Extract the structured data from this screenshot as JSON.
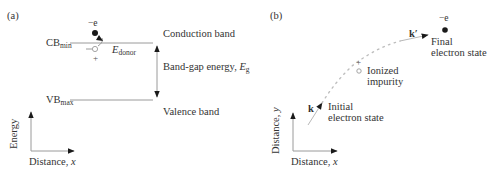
{
  "panel_a": {
    "label": "(a)",
    "electron_charge": "−e",
    "cb_label_main": "CB",
    "cb_label_sub": "min",
    "vb_label_main": "VB",
    "vb_label_sub": "max",
    "donor_minus": "−",
    "donor_plus": "+",
    "e_donor_main": "E",
    "e_donor_sub": "donor",
    "conduction_band": "Conduction band",
    "band_gap_text": "Band-gap energy, ",
    "band_gap_symbol": "E",
    "band_gap_sub": "g",
    "valence_band": "Valence band",
    "y_axis_label": "Energy",
    "x_axis_label_text": "Distance, ",
    "x_axis_label_var": "x"
  },
  "panel_b": {
    "label": "(b)",
    "electron_charge": "−e",
    "k_prime": "k′",
    "final_state_line1": "Final",
    "final_state_line2": "electron state",
    "impurity_plus": "+",
    "impurity_line1": "Ionized",
    "impurity_line2": "impurity",
    "k": "k",
    "initial_state_line1": "Initial",
    "initial_state_line2": "electron state",
    "y_axis_label_text": "Distance, ",
    "y_axis_label_var": "y",
    "x_axis_label_text": "Distance, ",
    "x_axis_label_var": "x"
  },
  "colors": {
    "line": "#9a9a9a",
    "ink": "#1a1a1a",
    "dots": "#b8b8b8"
  }
}
